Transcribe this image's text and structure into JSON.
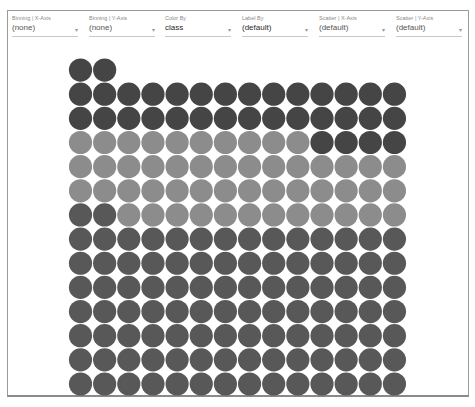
{
  "toolbar": {
    "dropdowns": [
      {
        "label": "Binning | X-Axis",
        "value": "(none)"
      },
      {
        "label": "Binning | Y-Axis",
        "value": "(none)"
      },
      {
        "label": "Color By",
        "value": "class"
      },
      {
        "label": "Label By",
        "value": "(default)"
      },
      {
        "label": "Scatter | X-Axis",
        "value": "(default)"
      },
      {
        "label": "Scatter | Y-Axis",
        "value": "(default)"
      }
    ]
  },
  "chart_data": {
    "type": "unit",
    "title": "",
    "xlabel": "",
    "ylabel": "",
    "columns": 14,
    "grid": false,
    "legend_position": "bottom (cut off)",
    "series": [
      {
        "name": "class A",
        "color": "#585858",
        "count": 100
      },
      {
        "name": "class B",
        "color": "#8c8c8c",
        "count": 50
      },
      {
        "name": "class C",
        "color": "#454545",
        "count": 34
      }
    ],
    "total": 184
  }
}
